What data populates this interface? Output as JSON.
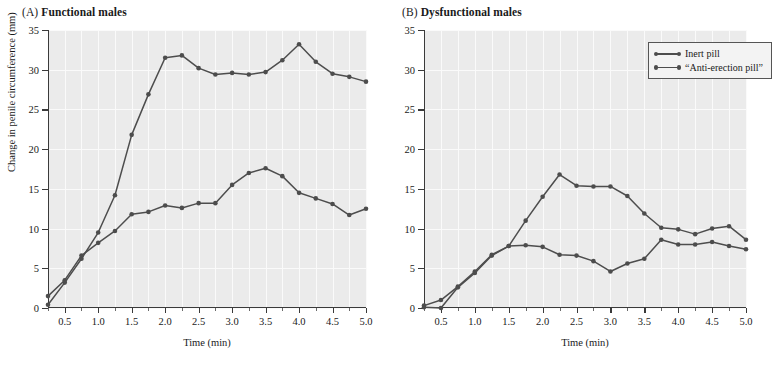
{
  "figure": {
    "xlabel": "Time (min)",
    "ylabel": "Change in penile circumference (mm)",
    "accent_color": "#4d4d4d",
    "plot_background": "#ebebeb",
    "gridline_color": "#fafafa"
  },
  "panels": [
    {
      "tag": "(A)",
      "title": "Functional males"
    },
    {
      "tag": "(B)",
      "title": "Dysfunctional males"
    }
  ],
  "legend": {
    "position": "top-right of panel B",
    "items": [
      {
        "label": "Inert pill"
      },
      {
        "label": "“Anti-erection pill”"
      }
    ]
  },
  "axes": {
    "y_ticks": [
      "0",
      "5",
      "10",
      "15",
      "20",
      "25",
      "30",
      "35"
    ],
    "x_ticks": [
      "0.5",
      "1.0",
      "1.5",
      "2.0",
      "2.5",
      "3.0",
      "3.5",
      "4.0",
      "4.5",
      "5.0"
    ]
  },
  "chart_data": [
    {
      "type": "line",
      "title": "(A) Functional males",
      "xlabel": "Time (min)",
      "ylabel": "Change in penile circumference (mm)",
      "xlim": [
        0.25,
        5.0
      ],
      "ylim": [
        0,
        35
      ],
      "grid": true,
      "legend_position": "none",
      "x": [
        0.25,
        0.5,
        0.75,
        1.0,
        1.25,
        1.5,
        1.75,
        2.0,
        2.25,
        2.5,
        2.75,
        3.0,
        3.25,
        3.5,
        3.75,
        4.0,
        4.25,
        4.5,
        4.75,
        5.0
      ],
      "series": [
        {
          "name": "Inert pill",
          "values": [
            0.4,
            3.2,
            6.2,
            9.5,
            14.2,
            21.8,
            26.9,
            31.5,
            31.8,
            30.2,
            29.4,
            29.6,
            29.4,
            29.7,
            31.2,
            33.2,
            31.0,
            29.5,
            29.1,
            28.5
          ]
        },
        {
          "name": "“Anti-erection pill”",
          "values": [
            1.5,
            3.5,
            6.6,
            8.2,
            9.7,
            11.8,
            12.1,
            12.9,
            12.6,
            13.2,
            13.2,
            15.5,
            17.0,
            17.6,
            16.6,
            14.5,
            13.8,
            13.1,
            11.7,
            12.5
          ]
        }
      ]
    },
    {
      "type": "line",
      "title": "(B) Dysfunctional males",
      "xlabel": "Time (min)",
      "ylabel": "Change in penile circumference (mm)",
      "xlim": [
        0.25,
        5.0
      ],
      "ylim": [
        0,
        35
      ],
      "grid": true,
      "legend_position": "top-right",
      "x": [
        0.25,
        0.5,
        0.75,
        1.0,
        1.25,
        1.5,
        1.75,
        2.0,
        2.25,
        2.5,
        2.75,
        3.0,
        3.25,
        3.5,
        3.75,
        4.0,
        4.25,
        4.5,
        4.75,
        5.0
      ],
      "series": [
        {
          "name": "Inert pill",
          "values": [
            0.1,
            0.0,
            2.6,
            4.4,
            6.6,
            7.8,
            11.0,
            14.0,
            16.8,
            15.4,
            15.3,
            15.3,
            14.1,
            11.9,
            10.1,
            9.9,
            9.3,
            10.0,
            10.3,
            8.6
          ]
        },
        {
          "name": "“Anti-erection pill”",
          "values": [
            0.3,
            1.0,
            2.7,
            4.6,
            6.7,
            7.8,
            7.9,
            7.7,
            6.7,
            6.6,
            5.9,
            4.6,
            5.6,
            6.2,
            8.6,
            8.0,
            8.0,
            8.3,
            7.8,
            7.4
          ]
        }
      ]
    }
  ]
}
